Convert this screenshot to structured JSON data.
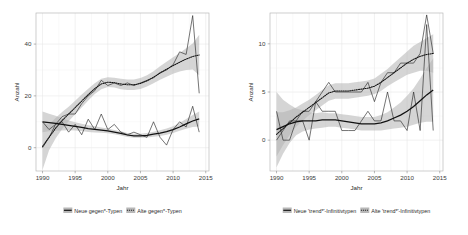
{
  "figure": {
    "panel_count": 2,
    "background": "#ffffff",
    "band_color": "#b3b3b3",
    "line_color": "#111111"
  },
  "chart_data": [
    {
      "type": "line",
      "panel": "left",
      "title": "",
      "xlabel": "Jahr",
      "ylabel": "Anzahl",
      "xlim": [
        1989,
        2015.5
      ],
      "ylim": [
        -9,
        52
      ],
      "xticks": [
        1990,
        1995,
        2000,
        2005,
        2010,
        2015
      ],
      "xtick_labels": [
        "1990",
        "1995",
        "2000",
        "2005",
        "2010",
        "2015"
      ],
      "yticks": [
        0,
        20,
        40
      ],
      "ytick_labels": [
        "0",
        "20",
        "40"
      ],
      "grid": true,
      "legend_position": "bottom",
      "x": [
        1990,
        1991,
        1992,
        1993,
        1994,
        1995,
        1996,
        1997,
        1998,
        1999,
        2000,
        2001,
        2002,
        2003,
        2004,
        2005,
        2006,
        2007,
        2008,
        2009,
        2010,
        2011,
        2012,
        2013,
        2014
      ],
      "series": [
        {
          "name": "Neue gegen*-Typen",
          "style": "solid",
          "observed": [
            10,
            7,
            9,
            10,
            6,
            9,
            5,
            11,
            7,
            13,
            7,
            9,
            6,
            5,
            6,
            5,
            4,
            10,
            4,
            1,
            7,
            10,
            8,
            16,
            6
          ],
          "smooth": [
            10.0,
            9.7,
            9.4,
            9.0,
            8.6,
            8.2,
            7.8,
            7.4,
            7.1,
            6.8,
            6.5,
            6.0,
            5.5,
            4.9,
            4.6,
            4.6,
            4.8,
            5.2,
            5.6,
            6.2,
            7.0,
            8.0,
            9.2,
            10.3,
            11.1
          ],
          "ci_lower": [
            6.0,
            6.3,
            6.5,
            6.6,
            6.7,
            6.6,
            6.4,
            6.1,
            5.9,
            5.8,
            5.6,
            5.2,
            4.7,
            4.1,
            3.8,
            3.8,
            3.9,
            4.2,
            4.5,
            5.0,
            5.7,
            6.5,
            7.3,
            8.0,
            8.2
          ],
          "ci_upper": [
            14.0,
            13.1,
            12.3,
            11.4,
            10.5,
            9.8,
            9.2,
            8.7,
            8.3,
            7.8,
            7.4,
            6.8,
            6.3,
            5.7,
            5.4,
            5.4,
            5.7,
            6.2,
            6.7,
            7.4,
            8.3,
            9.5,
            11.1,
            12.6,
            14.0
          ]
        },
        {
          "name": "Alte gegen*-Typen",
          "style": "dotted",
          "observed": [
            0,
            4,
            9,
            12,
            13,
            13,
            17,
            20,
            22,
            26,
            24,
            25,
            24,
            25,
            24,
            25,
            26,
            27,
            29,
            30,
            32,
            37,
            36,
            51,
            21
          ],
          "smooth": [
            0.5,
            4.0,
            7.5,
            10.5,
            13.0,
            15.5,
            18.0,
            20.5,
            22.8,
            24.6,
            25.3,
            25.1,
            24.6,
            24.3,
            24.3,
            24.8,
            25.8,
            27.2,
            28.8,
            30.3,
            31.7,
            33.0,
            34.2,
            35.2,
            35.8
          ],
          "ci_lower": [
            -8.5,
            -1.0,
            3.5,
            7.2,
            10.2,
            12.9,
            15.5,
            18.2,
            20.7,
            22.6,
            23.4,
            23.2,
            22.6,
            22.3,
            22.3,
            22.7,
            23.6,
            24.9,
            26.2,
            27.4,
            28.5,
            29.4,
            30.0,
            30.2,
            28.0
          ],
          "ci_upper": [
            9.5,
            9.0,
            11.5,
            13.8,
            15.8,
            18.1,
            20.5,
            22.8,
            24.9,
            26.6,
            27.2,
            27.0,
            26.6,
            26.3,
            26.3,
            26.9,
            28.0,
            29.5,
            31.4,
            33.2,
            34.9,
            36.6,
            38.4,
            40.2,
            43.6
          ]
        }
      ]
    },
    {
      "type": "line",
      "panel": "right",
      "title": "",
      "xlabel": "Jahr",
      "ylabel": "Anzahl",
      "xlim": [
        1989,
        2015.5
      ],
      "ylim": [
        -3.2,
        13.2
      ],
      "xticks": [
        1990,
        1995,
        2000,
        2005,
        2010,
        2015
      ],
      "xtick_labels": [
        "1990",
        "1995",
        "2000",
        "2005",
        "2010",
        "2015"
      ],
      "yticks": [
        0,
        5,
        10
      ],
      "ytick_labels": [
        "0",
        "5",
        "10"
      ],
      "grid": true,
      "legend_position": "bottom",
      "x": [
        1990,
        1991,
        1992,
        1993,
        1994,
        1995,
        1996,
        1997,
        1998,
        1999,
        2000,
        2001,
        2002,
        2003,
        2004,
        2005,
        2006,
        2007,
        2008,
        2009,
        2010,
        2011,
        2012,
        2013,
        2014
      ],
      "series": [
        {
          "name": "Neue 'trend*'-Infinitivtypen",
          "style": "solid",
          "observed": [
            3,
            0,
            0,
            2,
            2,
            0,
            4,
            3,
            3,
            3,
            1,
            1,
            1,
            2,
            3,
            2,
            2,
            5,
            2,
            2,
            1,
            5,
            1,
            12,
            1
          ],
          "smooth": [
            1.1,
            1.4,
            1.7,
            1.9,
            2.0,
            2.0,
            2.0,
            2.1,
            2.1,
            2.1,
            2.0,
            1.9,
            1.8,
            1.7,
            1.7,
            1.7,
            1.8,
            2.0,
            2.3,
            2.6,
            3.0,
            3.5,
            4.1,
            4.7,
            5.2
          ],
          "ci_lower": [
            -2.8,
            -1.4,
            -0.3,
            0.5,
            0.9,
            1.1,
            1.2,
            1.3,
            1.4,
            1.4,
            1.3,
            1.2,
            1.1,
            1.0,
            1.0,
            1.0,
            1.0,
            1.1,
            1.2,
            1.3,
            1.4,
            1.6,
            1.8,
            1.9,
            1.9
          ],
          "ci_upper": [
            5.0,
            4.2,
            3.7,
            3.3,
            3.1,
            2.9,
            2.8,
            2.9,
            2.8,
            2.8,
            2.7,
            2.6,
            2.5,
            2.4,
            2.4,
            2.4,
            2.6,
            2.9,
            3.4,
            3.9,
            4.6,
            5.4,
            6.4,
            7.5,
            8.5
          ]
        },
        {
          "name": "Alte 'trend*'-Infinitivtypen",
          "style": "dotted",
          "observed": [
            0,
            1,
            2,
            2,
            3,
            3,
            4,
            5,
            6,
            5,
            5,
            5,
            5,
            5,
            6,
            4,
            6,
            7,
            7,
            8,
            8,
            8,
            9,
            13,
            9
          ],
          "smooth": [
            0.6,
            1.2,
            1.8,
            2.4,
            2.9,
            3.4,
            3.9,
            4.4,
            4.9,
            5.1,
            5.1,
            5.1,
            5.2,
            5.3,
            5.4,
            5.6,
            6.0,
            6.5,
            7.0,
            7.5,
            8.0,
            8.4,
            8.7,
            8.9,
            9.0
          ],
          "ci_lower": [
            -1.7,
            -0.5,
            0.5,
            1.4,
            2.0,
            2.6,
            3.1,
            3.6,
            4.1,
            4.3,
            4.3,
            4.3,
            4.4,
            4.5,
            4.6,
            4.8,
            5.1,
            5.6,
            6.0,
            6.4,
            6.8,
            7.0,
            7.2,
            7.2,
            7.0
          ],
          "ci_upper": [
            2.9,
            2.9,
            3.1,
            3.4,
            3.8,
            4.2,
            4.7,
            5.2,
            5.7,
            5.9,
            5.9,
            5.9,
            6.0,
            6.1,
            6.2,
            6.4,
            6.9,
            7.4,
            8.0,
            8.6,
            9.2,
            9.8,
            10.2,
            10.6,
            11.0
          ]
        }
      ]
    }
  ]
}
